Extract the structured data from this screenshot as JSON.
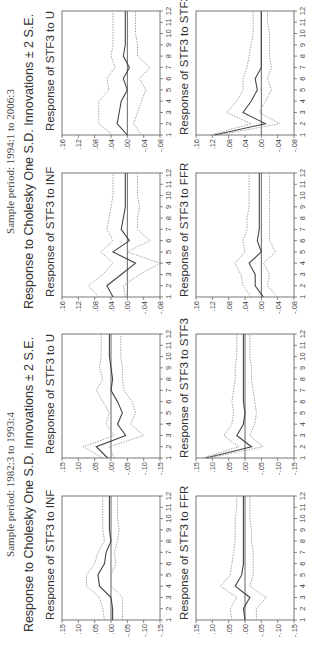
{
  "chart_data": [
    {
      "section_title": "Sample period: 1994:1 to 2006:3",
      "subtitle": "Response to Cholesky One S.D. Innovations ± 2 S.E.",
      "type": "line",
      "x": [
        1,
        2,
        3,
        4,
        5,
        6,
        7,
        8,
        9,
        10,
        11,
        12
      ],
      "ylim": [
        -0.08,
        0.16
      ],
      "yticks": [
        ".16",
        ".12",
        ".08",
        ".04",
        ".00",
        "-.04",
        "-.08"
      ],
      "xticks": [
        "1",
        "2",
        "3",
        "4",
        "5",
        "6",
        "7",
        "8",
        "9",
        "10",
        "11",
        "12"
      ],
      "panels": [
        {
          "title": "Response of STF3 to INF",
          "series": [
            {
              "name": "response",
              "values": [
                0.035,
                0.05,
                0.015,
                -0.02,
                0.035,
                -0.005,
                0.015,
                0.01,
                0.005,
                0.005,
                0.005,
                0.005
              ]
            },
            {
              "name": "upper",
              "values": [
                0.07,
                0.095,
                0.06,
                0.035,
                0.065,
                0.035,
                0.05,
                0.045,
                0.04,
                0.035,
                0.035,
                0.035
              ]
            },
            {
              "name": "lower",
              "values": [
                0.005,
                0.01,
                -0.03,
                -0.08,
                0.0,
                -0.055,
                -0.025,
                -0.025,
                -0.03,
                -0.025,
                -0.025,
                -0.025
              ]
            }
          ]
        },
        {
          "title": "Response of STF3 to U",
          "series": [
            {
              "name": "response",
              "values": [
                0.0,
                0.025,
                0.02,
                0.015,
                0.0,
                0.01,
                -0.005,
                0.01,
                0.005,
                0.005,
                0.005,
                0.005
              ]
            },
            {
              "name": "upper",
              "values": [
                0.035,
                0.07,
                0.07,
                0.07,
                0.045,
                0.05,
                0.03,
                0.04,
                0.035,
                0.035,
                0.035,
                0.035
              ]
            },
            {
              "name": "lower",
              "values": [
                -0.035,
                -0.015,
                -0.025,
                -0.035,
                -0.045,
                -0.03,
                -0.055,
                -0.025,
                -0.025,
                -0.02,
                -0.02,
                -0.02
              ]
            }
          ]
        },
        {
          "title": "Response of STF3 to FFR",
          "series": [
            {
              "name": "response",
              "values": [
                -0.005,
                0.015,
                0.015,
                0.03,
                0.0,
                0.01,
                0.005,
                0.005,
                0.005,
                0.005,
                0.005,
                0.005
              ]
            },
            {
              "name": "upper",
              "values": [
                0.025,
                0.045,
                0.05,
                0.065,
                0.04,
                0.045,
                0.035,
                0.035,
                0.03,
                0.03,
                0.03,
                0.03
              ]
            },
            {
              "name": "lower",
              "values": [
                -0.04,
                -0.015,
                -0.02,
                -0.005,
                -0.035,
                -0.02,
                -0.02,
                -0.02,
                -0.02,
                -0.02,
                -0.02,
                -0.02
              ]
            }
          ]
        },
        {
          "title": "Response of STF3 to STF3",
          "series": [
            {
              "name": "response",
              "values": [
                0.115,
                -0.01,
                0.045,
                0.025,
                0.01,
                0.015,
                0.0,
                0.0,
                0.0,
                0.0,
                0.0,
                0.0
              ]
            },
            {
              "name": "upper",
              "values": [
                0.125,
                0.025,
                0.085,
                0.06,
                0.045,
                0.045,
                0.035,
                0.03,
                0.025,
                0.02,
                0.02,
                0.02
              ]
            },
            {
              "name": "lower",
              "values": [
                0.105,
                -0.045,
                0.005,
                -0.01,
                -0.025,
                -0.015,
                -0.025,
                -0.02,
                -0.02,
                -0.02,
                -0.015,
                -0.015
              ]
            }
          ]
        }
      ]
    },
    {
      "section_title": "Sample period: 1982:3 to 1993:4",
      "subtitle": "Response to Cholesky One S.D. Innovations ± 2 S.E.",
      "type": "line",
      "x": [
        1,
        2,
        3,
        4,
        5,
        6,
        7,
        8,
        9,
        10,
        11,
        12
      ],
      "ylim": [
        -0.15,
        0.15
      ],
      "yticks": [
        ".15",
        ".10",
        ".05",
        ".00",
        "-.05",
        "-.10",
        "-.15"
      ],
      "xticks": [
        "1",
        "2",
        "3",
        "4",
        "5",
        "6",
        "7",
        "8",
        "9",
        "10",
        "11",
        "12"
      ],
      "panels": [
        {
          "title": "Response of STF3 to INF",
          "series": [
            {
              "name": "response",
              "values": [
                -0.005,
                -0.005,
                0.0,
                0.035,
                0.04,
                0.02,
                0.015,
                0.0,
                0.005,
                0.005,
                0.005,
                0.005
              ]
            },
            {
              "name": "upper",
              "values": [
                0.02,
                0.025,
                0.035,
                0.075,
                0.075,
                0.05,
                0.04,
                0.02,
                0.025,
                0.025,
                0.025,
                0.025
              ]
            },
            {
              "name": "lower",
              "values": [
                -0.035,
                -0.035,
                -0.035,
                0.0,
                0.0,
                -0.015,
                -0.01,
                -0.02,
                -0.025,
                -0.02,
                -0.02,
                -0.02
              ]
            }
          ]
        },
        {
          "title": "Response of STF3 to U",
          "series": [
            {
              "name": "response",
              "values": [
                0.01,
                0.045,
                -0.045,
                -0.02,
                -0.035,
                -0.02,
                0.0,
                -0.005,
                0.0,
                0.005,
                0.005,
                0.005
              ]
            },
            {
              "name": "upper",
              "values": [
                0.025,
                0.085,
                -0.01,
                0.015,
                0.005,
                0.025,
                0.045,
                0.025,
                0.035,
                0.03,
                0.03,
                0.03
              ]
            },
            {
              "name": "lower",
              "values": [
                -0.01,
                0.005,
                -0.1,
                -0.06,
                -0.075,
                -0.065,
                -0.04,
                -0.035,
                -0.035,
                -0.03,
                -0.03,
                -0.03
              ]
            }
          ]
        },
        {
          "title": "Response of STF3 to FFR",
          "series": [
            {
              "name": "response",
              "values": [
                0.0,
                0.005,
                -0.015,
                0.03,
                0.01,
                0.005,
                0.005,
                0.005,
                0.005,
                0.005,
                0.005,
                0.005
              ]
            },
            {
              "name": "upper",
              "values": [
                0.04,
                0.045,
                0.025,
                0.075,
                0.045,
                0.04,
                0.035,
                0.03,
                0.03,
                0.03,
                0.025,
                0.025
              ]
            },
            {
              "name": "lower",
              "values": [
                -0.035,
                -0.035,
                -0.065,
                -0.015,
                -0.025,
                -0.025,
                -0.025,
                -0.02,
                -0.02,
                -0.015,
                -0.015,
                -0.015
              ]
            }
          ]
        },
        {
          "title": "Response of STF3 to STF3",
          "series": [
            {
              "name": "response",
              "values": [
                0.12,
                -0.02,
                0.025,
                0.005,
                0.0,
                0.005,
                0.005,
                0.005,
                0.005,
                0.005,
                0.005,
                0.005
              ]
            },
            {
              "name": "upper",
              "values": [
                0.13,
                0.02,
                0.065,
                0.04,
                0.035,
                0.04,
                0.035,
                0.03,
                0.03,
                0.025,
                0.025,
                0.025
              ]
            },
            {
              "name": "lower",
              "values": [
                0.11,
                -0.055,
                -0.015,
                -0.03,
                -0.035,
                -0.03,
                -0.025,
                -0.02,
                -0.02,
                -0.015,
                -0.015,
                -0.015
              ]
            }
          ]
        }
      ]
    }
  ],
  "colors": {
    "line": "#444444",
    "band": "#9a9a9a",
    "axis": "#555555",
    "zero": "#555555"
  }
}
